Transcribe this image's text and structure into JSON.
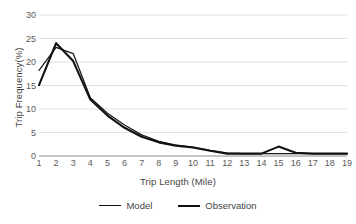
{
  "chart_data": {
    "type": "line",
    "title": "",
    "xlabel": "Trip Length (Mile)",
    "ylabel": "Trip Frequency(%)",
    "x": [
      1,
      2,
      3,
      4,
      5,
      6,
      7,
      8,
      9,
      10,
      11,
      12,
      13,
      14,
      15,
      16,
      17,
      18,
      19
    ],
    "xlim": [
      1,
      19
    ],
    "ylim": [
      0,
      30
    ],
    "yticks": [
      0,
      5,
      10,
      15,
      20,
      25,
      30
    ],
    "xticks": [
      1,
      2,
      3,
      4,
      5,
      6,
      7,
      8,
      9,
      10,
      11,
      12,
      13,
      14,
      15,
      16,
      17,
      18,
      19
    ],
    "grid": "horizontal",
    "legend_position": "bottom",
    "series": [
      {
        "name": "Model",
        "line_width": "thin",
        "color": "#1a1a1a",
        "values": [
          18.2,
          23.1,
          21.8,
          12.4,
          9.1,
          6.6,
          4.5,
          3.1,
          2.3,
          1.9,
          1.2,
          0.6,
          0.5,
          0.5,
          0.5,
          0.5,
          0.5,
          0.5,
          0.5
        ]
      },
      {
        "name": "Observation",
        "line_width": "thick",
        "color": "#111111",
        "values": [
          15.1,
          24.0,
          20.2,
          12.0,
          8.6,
          6.0,
          4.1,
          2.9,
          2.2,
          1.8,
          1.1,
          0.5,
          0.5,
          0.5,
          2.0,
          0.7,
          0.5,
          0.5,
          0.5
        ]
      }
    ]
  },
  "legend": {
    "items": [
      {
        "label": "Model"
      },
      {
        "label": "Observation"
      }
    ]
  }
}
